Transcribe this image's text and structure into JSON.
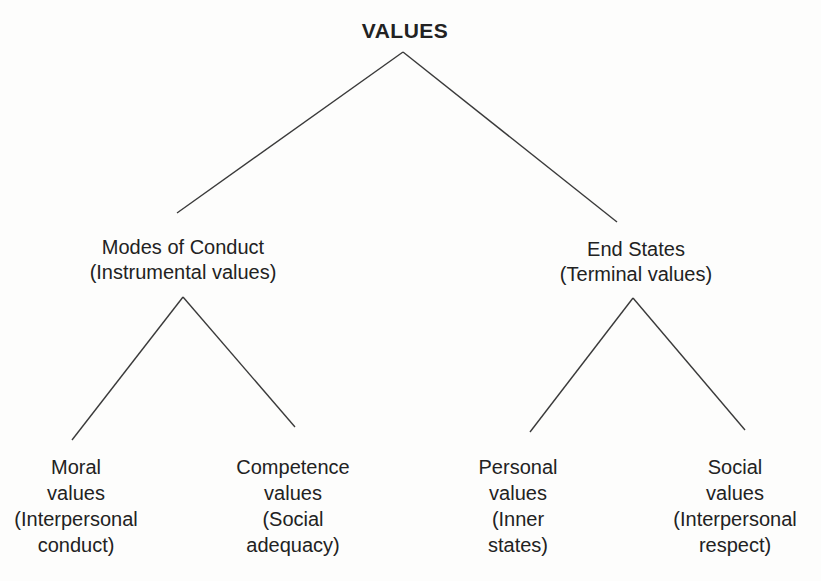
{
  "diagram": {
    "title": "VALUES",
    "colors": {
      "background": "#fdfdfc",
      "text": "#222222",
      "line": "#3a3a3a"
    },
    "nodes": {
      "root": {
        "label": "VALUES"
      },
      "modes_of_conduct": {
        "label": "Modes of Conduct",
        "sublabel": "(Instrumental values)"
      },
      "end_states": {
        "label": "End States",
        "sublabel": "(Terminal values)"
      },
      "moral": {
        "lines": [
          "Moral",
          "values",
          "(Interpersonal",
          "conduct)"
        ]
      },
      "competence": {
        "lines": [
          "Competence",
          "values",
          "(Social",
          "adequacy)"
        ]
      },
      "personal": {
        "lines": [
          "Personal",
          "values",
          "(Inner",
          "states)"
        ]
      },
      "social": {
        "lines": [
          "Social",
          "values",
          "(Interpersonal",
          "respect)"
        ]
      }
    }
  }
}
